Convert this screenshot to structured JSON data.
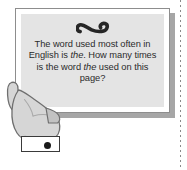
{
  "scene": {
    "title": "illustration-hand-holding-question-sign",
    "background_color": "#ffffff"
  },
  "trim_line": {
    "name": "dotted-trim-line",
    "color": "#8a8a8a",
    "style": "dotted-vertical"
  },
  "sign": {
    "ornament_icon": "infinity-squiggle-ornament",
    "border_color": "#8d8d8d",
    "mat_color": "#ffffff",
    "panel_color": "#e4e4e4",
    "shadow_color": "#a6a6a6",
    "question": {
      "full_text": "The word used most often in English is the. How many times is the word the used on this page?",
      "segments": [
        {
          "text": "The word used most often in English is ",
          "style": "normal"
        },
        {
          "text": "the",
          "style": "italic"
        },
        {
          "text": ". How many times is the word ",
          "style": "normal"
        },
        {
          "text": "the",
          "style": "italic"
        },
        {
          "text": " used on this page?",
          "style": "normal"
        }
      ],
      "lines": [
        "The word used most often in",
        "English is the. How many",
        "times is the word the used",
        "on this page?"
      ],
      "text_color": "#2b2b2b"
    }
  },
  "hand": {
    "name": "hand-gripping-sign",
    "fill_color": "#d6d6d6",
    "outline_color": "#6f6f6f",
    "shade_color": "#c2c2c2"
  },
  "cuff": {
    "name": "wrist-cuff-band",
    "fill_color": "#ffffff",
    "border_color": "#3a3a3a",
    "dot_color": "#1a1a1a"
  }
}
